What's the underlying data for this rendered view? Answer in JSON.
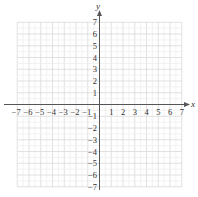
{
  "chart_data": {
    "type": "scatter",
    "title": "",
    "xlabel": "x",
    "ylabel": "y",
    "xlim": [
      -7,
      7
    ],
    "ylim": [
      -7,
      7
    ],
    "grid": true,
    "x_ticks": [
      "−7",
      "−6",
      "−5",
      "−4",
      "−3",
      "−2",
      "−1",
      "1",
      "2",
      "3",
      "4",
      "5",
      "6",
      "7"
    ],
    "y_ticks": [
      "7",
      "6",
      "5",
      "4",
      "3",
      "2",
      "1",
      "−1",
      "−2",
      "−3",
      "−4",
      "−5",
      "−6",
      "−7"
    ],
    "x": [],
    "y": [],
    "series": []
  },
  "colors": {
    "grid": "#d9d9d9",
    "axis": "#555555",
    "text": "#333333"
  }
}
